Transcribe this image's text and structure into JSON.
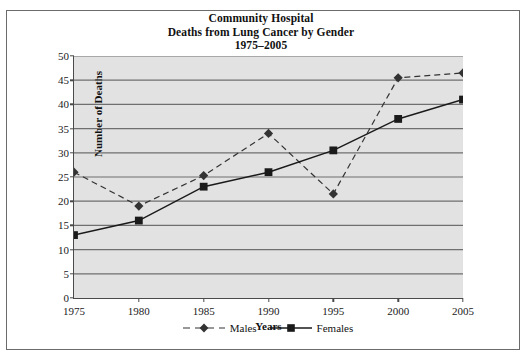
{
  "chart_data": {
    "type": "line",
    "title": "Community Hospital",
    "title_line2": "Deaths from Lung Cancer by Gender",
    "title_line3": "1975–2005",
    "xlabel": "Years",
    "ylabel": "Number of Deaths",
    "x": [
      1975,
      1980,
      1985,
      1990,
      1995,
      2000,
      2005
    ],
    "xticklabels": [
      "1975",
      "1980",
      "1985",
      "1990",
      "1995",
      "2000",
      "2005"
    ],
    "yticklabels": [
      "0",
      "5",
      "10",
      "15",
      "20",
      "25",
      "30",
      "35",
      "40",
      "45",
      "50"
    ],
    "yticks": [
      0,
      5,
      10,
      15,
      20,
      25,
      30,
      35,
      40,
      45,
      50
    ],
    "xlim": [
      1975,
      2005
    ],
    "ylim": [
      0,
      50
    ],
    "grid": "horizontal",
    "legend_position": "bottom-center",
    "plot_background": "#e2e2e2",
    "series": [
      {
        "name": "Males",
        "marker": "diamond",
        "linestyle": "dashed",
        "color": "#333333",
        "values": [
          26,
          19,
          25.3,
          34,
          21.5,
          45.5,
          46.5
        ]
      },
      {
        "name": "Females",
        "marker": "square",
        "linestyle": "solid",
        "color": "#1a1a1a",
        "values": [
          13,
          16,
          23,
          26,
          30.5,
          37,
          41
        ]
      }
    ]
  },
  "legend": {
    "items": [
      {
        "label": "Males"
      },
      {
        "label": "Females"
      }
    ]
  }
}
